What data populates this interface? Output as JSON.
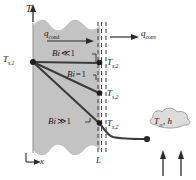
{
  "figure": {
    "axes": {
      "vertical_label": "T",
      "horizontal_label": "x",
      "wall_thickness_label": "L"
    },
    "labels": {
      "surface_temp_left": {
        "base": "T",
        "sub": "s,1"
      },
      "surface_temp_right": {
        "base": "T",
        "sub": "s,2"
      },
      "heat_cond": {
        "base": "q",
        "sub": "cond"
      },
      "heat_conv": {
        "base": "q",
        "sub": "conv"
      },
      "fluid": {
        "temp": "T",
        "temp_sub": "∞",
        "sep": ", ",
        "coeff": "h"
      }
    },
    "curves": [
      {
        "name": "bi-much-less-than-1",
        "label_base": "Bi",
        "label_rel": "≪",
        "label_val": "1",
        "end_y": 62
      },
      {
        "name": "bi-equal-1",
        "label_base": "Bi",
        "label_rel": "=",
        "label_val": "1",
        "end_y": 93
      },
      {
        "name": "bi-much-greater-than-1",
        "label_base": "Bi",
        "label_rel": "≫",
        "label_val": "1",
        "end_y": 123
      }
    ],
    "colors": {
      "wall_fill": "#c3c3c3",
      "wall_edge": "#8f8f8f",
      "curve": "#3c3c3c",
      "dashed": "#4a4a4a",
      "cloud_fill": "#dcdcdc",
      "cloud_edge": "#9a9a9a",
      "text": "#1a1a1a"
    }
  }
}
